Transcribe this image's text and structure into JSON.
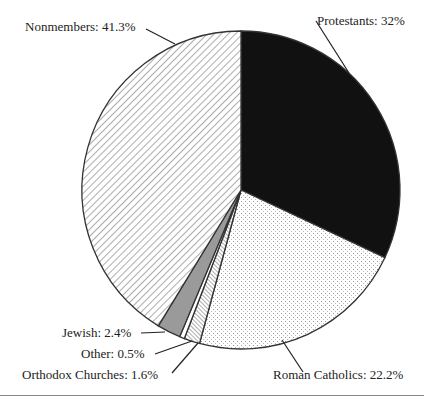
{
  "chart_data": {
    "type": "pie",
    "title": "",
    "center": [
      241,
      190
    ],
    "radius": 159,
    "start_angle_deg": 0,
    "direction": "clockwise",
    "slices": [
      {
        "label": "Protestants",
        "value": 32.0,
        "display": "Protestants: 32%",
        "pattern": "solid-black"
      },
      {
        "label": "Roman Catholics",
        "value": 22.2,
        "display": "Roman Catholics: 22.2%",
        "pattern": "dots"
      },
      {
        "label": "Orthodox Churches",
        "value": 1.6,
        "display": "Orthodox Churches: 1.6%",
        "pattern": "fine-hatch-forward"
      },
      {
        "label": "Other",
        "value": 0.5,
        "display": "Other: 0.5%",
        "pattern": "white"
      },
      {
        "label": "Jewish",
        "value": 2.4,
        "display": "Jewish: 2.4%",
        "pattern": "solid-gray"
      },
      {
        "label": "Nonmembers",
        "value": 41.3,
        "display": "Nonmembers: 41.3%",
        "pattern": "hatch-back"
      }
    ],
    "colors": {
      "protestants": "#111111",
      "gray": "#9a9a9a",
      "outline": "#333333"
    }
  },
  "labels": {
    "protestants": "Protestants: 32%",
    "roman_catholics": "Roman Catholics: 22.2%",
    "orthodox": "Orthodox Churches: 1.6%",
    "other": "Other: 0.5%",
    "jewish": "Jewish: 2.4%",
    "nonmembers": "Nonmembers: 41.3%"
  }
}
